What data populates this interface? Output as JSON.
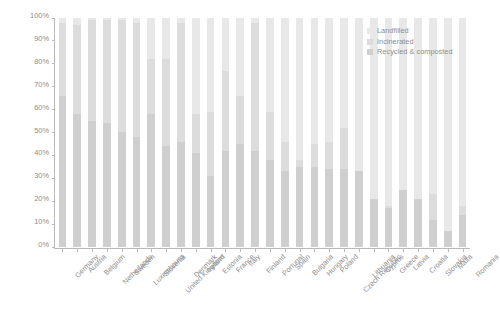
{
  "chart_data": {
    "type": "bar",
    "title": "",
    "subtitle": "",
    "xlabel": "",
    "ylabel": "",
    "stacked": true,
    "normalized_percent": true,
    "grid": false,
    "ylim": [
      0,
      100
    ],
    "ytick_labels": [
      "0%",
      "10%",
      "20%",
      "30%",
      "40%",
      "50%",
      "60%",
      "70%",
      "80%",
      "90%",
      "100%"
    ],
    "ytick_values": [
      0,
      10,
      20,
      30,
      40,
      50,
      60,
      70,
      80,
      90,
      100
    ],
    "legend_position": "top-right",
    "stack_order_bottom_to_top": [
      "Recycled & composted",
      "Incinerated",
      "Landfilled"
    ],
    "categories": [
      "Germany",
      "Austria",
      "Belgium",
      "Netherlands",
      "Sweden",
      "Luxembourg",
      "Slovenia",
      "United Kingdom",
      "Denmark",
      "Ireland",
      "Estonia",
      "France",
      "Italy",
      "Finland",
      "Portugal",
      "Spain",
      "Bulgaria",
      "Hungary",
      "Poland",
      "Czech Republic",
      "Lithuania",
      "Cyprus",
      "Greece",
      "Latvia",
      "Croatia",
      "Slovakia",
      "Malta",
      "Romania"
    ],
    "series": [
      {
        "name": "Recycled & composted",
        "color": "#cfcfcf",
        "values": [
          66,
          58,
          55,
          54,
          50,
          48,
          58,
          44,
          46,
          41,
          31,
          42,
          45,
          42,
          38,
          33,
          35,
          35,
          34,
          34,
          33,
          21,
          17,
          25,
          21,
          12,
          7,
          14
        ]
      },
      {
        "name": "Incinerated",
        "color": "#dcdcdc",
        "values": [
          32,
          39,
          44,
          45,
          49,
          50,
          24,
          38,
          52,
          17,
          28,
          35,
          21,
          56,
          21,
          13,
          3,
          10,
          12,
          18,
          0,
          0,
          1,
          0,
          0,
          11,
          0,
          4
        ]
      },
      {
        "name": "Landfilled",
        "color": "#e8e8e8",
        "values": [
          2,
          3,
          1,
          1,
          1,
          2,
          18,
          18,
          2,
          42,
          41,
          23,
          34,
          2,
          41,
          54,
          62,
          55,
          54,
          48,
          67,
          79,
          82,
          75,
          79,
          77,
          93,
          82
        ]
      }
    ]
  },
  "legend": {
    "items": [
      {
        "label": "Landfilled",
        "color": "#e8e8e8"
      },
      {
        "label": "Incinerated",
        "color": "#dcdcdc"
      },
      {
        "label": "Recycled & composted",
        "color": "#cfcfcf"
      }
    ]
  }
}
